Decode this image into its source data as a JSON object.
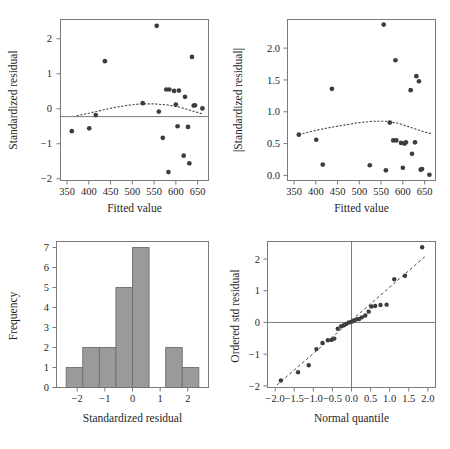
{
  "figure": {
    "kind": "four-panel regression diagnostics",
    "background": "#ffffff",
    "point_color": "#3d3d3d",
    "bar_color": "#9a9a9a",
    "axis_color": "#7b7b7b"
  },
  "chart_data": [
    {
      "id": "residuals-vs-fitted",
      "type": "scatter",
      "title": "",
      "xlabel": "Fitted value",
      "ylabel": "Standardized residual",
      "xlim": [
        335,
        675
      ],
      "ylim": [
        -2.05,
        2.55
      ],
      "xticks": [
        350,
        400,
        450,
        500,
        550,
        600,
        650
      ],
      "xticklabels": [
        "350",
        "400",
        "450",
        "500",
        "550",
        "600",
        "650"
      ],
      "yticks": [
        -2,
        -1,
        0,
        1,
        2
      ],
      "yticklabels": [
        "−2",
        "−1",
        "0",
        "1",
        "2"
      ],
      "grid": false,
      "legend": null,
      "reference_lines": [
        {
          "type": "horizontal",
          "y": 0
        }
      ],
      "x": [
        361,
        401,
        416,
        437,
        524,
        556,
        561,
        570,
        578,
        583,
        585,
        596,
        600,
        604,
        607,
        618,
        621,
        628,
        631,
        637,
        641,
        644,
        661
      ],
      "y": [
        -0.64,
        -0.56,
        -0.18,
        1.36,
        0.16,
        2.37,
        -0.08,
        -0.83,
        0.55,
        -1.81,
        0.55,
        0.51,
        0.12,
        -0.5,
        0.52,
        -1.34,
        0.34,
        -0.52,
        -1.56,
        1.48,
        0.09,
        0.1,
        0.01
      ],
      "smoother": {
        "style": "dotted-loess",
        "x": [
          372,
          400,
          430,
          460,
          490,
          520,
          550,
          580,
          610,
          640,
          662
        ],
        "y": [
          -0.2,
          -0.13,
          -0.04,
          0.04,
          0.1,
          0.14,
          0.14,
          0.11,
          0.04,
          -0.07,
          -0.15
        ]
      }
    },
    {
      "id": "abs-residuals-vs-fitted",
      "type": "scatter",
      "title": "",
      "xlabel": "Fitted value",
      "ylabel": "|Standardized residual|",
      "xlim": [
        335,
        675
      ],
      "ylim": [
        -0.08,
        2.45
      ],
      "xticks": [
        350,
        400,
        450,
        500,
        550,
        600,
        650
      ],
      "xticklabels": [
        "350",
        "400",
        "450",
        "500",
        "550",
        "600",
        "650"
      ],
      "yticks": [
        0.0,
        0.5,
        1.0,
        1.5,
        2.0
      ],
      "yticklabels": [
        "0.0",
        "0.5",
        "1.0",
        "1.5",
        "2.0"
      ],
      "grid": false,
      "legend": null,
      "x": [
        361,
        401,
        416,
        437,
        524,
        556,
        561,
        570,
        578,
        583,
        585,
        596,
        600,
        604,
        607,
        618,
        621,
        628,
        631,
        637,
        641,
        644,
        661
      ],
      "y": [
        0.64,
        0.56,
        0.17,
        1.36,
        0.16,
        2.37,
        0.08,
        0.83,
        0.55,
        1.81,
        0.55,
        0.51,
        0.12,
        0.5,
        0.52,
        1.34,
        0.34,
        0.52,
        1.56,
        1.48,
        0.09,
        0.1,
        0.01
      ],
      "smoother": {
        "style": "dotted-loess",
        "x": [
          361,
          395,
          430,
          465,
          500,
          530,
          560,
          590,
          620,
          650,
          665
        ],
        "y": [
          0.64,
          0.7,
          0.75,
          0.79,
          0.83,
          0.85,
          0.85,
          0.82,
          0.75,
          0.68,
          0.66
        ]
      }
    },
    {
      "id": "histogram-of-residuals",
      "type": "bar",
      "title": "",
      "xlabel": "Standardized residual",
      "ylabel": "Frequency",
      "xlim": [
        -2.75,
        2.75
      ],
      "ylim": [
        0,
        7.3
      ],
      "xticks": [
        -2,
        -1,
        0,
        1,
        2
      ],
      "xticklabels": [
        "−2",
        "−1",
        "0",
        "1",
        "2"
      ],
      "yticks": [
        0,
        1,
        2,
        3,
        4,
        5,
        6,
        7
      ],
      "yticklabels": [
        "0",
        "1",
        "2",
        "3",
        "4",
        "5",
        "6",
        "7"
      ],
      "grid": false,
      "legend": null,
      "bin_edges": [
        -2.4,
        -1.8,
        -1.2,
        -0.6,
        0.0,
        0.6,
        1.2,
        1.8,
        2.4
      ],
      "categories": [
        "-2.4 to -1.8",
        "-1.8 to -1.2",
        "-1.2 to -0.6",
        "-0.6 to 0.0",
        "0.0 to 0.6",
        "0.6 to 1.2",
        "1.2 to 1.8",
        "1.8 to 2.4"
      ],
      "values": [
        1,
        2,
        2,
        5,
        7,
        0,
        2,
        1
      ]
    },
    {
      "id": "normal-qq-plot",
      "type": "scatter",
      "title": "",
      "xlabel": "Normal quantile",
      "ylabel": "Ordered std residual",
      "xlim": [
        -2.2,
        2.2
      ],
      "ylim": [
        -2.05,
        2.55
      ],
      "xticks": [
        -2.0,
        -1.5,
        -1.0,
        -0.5,
        0.0,
        0.5,
        1.0,
        1.5,
        2.0
      ],
      "xticklabels": [
        "−2.0",
        "−1.5",
        "−1.0",
        "−0.5",
        "0.0",
        "0.5",
        "1.0",
        "1.5",
        "2.0"
      ],
      "yticks": [
        -2,
        -1,
        0,
        1,
        2
      ],
      "yticklabels": [
        "−2",
        "−1",
        "0",
        "1",
        "2"
      ],
      "grid": false,
      "legend": null,
      "reference_lines": [
        {
          "type": "horizontal",
          "y": 0
        },
        {
          "type": "vertical",
          "x": 0
        }
      ],
      "fit_line": {
        "style": "dashed",
        "x": [
          -1.95,
          1.95
        ],
        "y": [
          -1.97,
          2.1
        ]
      },
      "x": [
        -1.85,
        -1.4,
        -1.12,
        -0.92,
        -0.76,
        -0.62,
        -0.52,
        -0.45,
        -0.36,
        -0.27,
        -0.2,
        -0.14,
        -0.07,
        0.0,
        0.07,
        0.14,
        0.2,
        0.27,
        0.36,
        0.45,
        0.52,
        0.62,
        0.76,
        0.92,
        1.12,
        1.4,
        1.85
      ],
      "y": [
        -1.83,
        -1.57,
        -1.35,
        -0.84,
        -0.65,
        -0.56,
        -0.55,
        -0.51,
        -0.2,
        -0.12,
        -0.09,
        -0.05,
        0.0,
        0.02,
        0.06,
        0.1,
        0.11,
        0.16,
        0.22,
        0.34,
        0.5,
        0.52,
        0.55,
        0.56,
        1.36,
        1.47,
        2.37
      ]
    }
  ]
}
